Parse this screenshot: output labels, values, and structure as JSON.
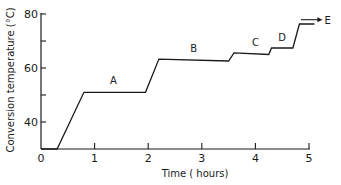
{
  "chart_data": {
    "type": "line",
    "title": "",
    "xlabel": "Time ( hours)",
    "ylabel": "Conversion temperature (°C)",
    "xlim": [
      0,
      5.2
    ],
    "ylim": [
      30,
      80
    ],
    "x_ticks": [
      0,
      1,
      2,
      3,
      4,
      5
    ],
    "x_tick_labels": [
      "0",
      "1",
      "2",
      "3",
      "4",
      "5"
    ],
    "y_ticks": [
      40,
      60,
      80
    ],
    "y_tick_labels": [
      "40",
      "60",
      "80"
    ],
    "y_minor_ticks": [
      50,
      70
    ],
    "grid": false,
    "legend": null,
    "series": [
      {
        "name": "Conversion temperature",
        "points": [
          {
            "x": 0.0,
            "y": 30
          },
          {
            "x": 0.3,
            "y": 30
          },
          {
            "x": 0.8,
            "y": 51
          },
          {
            "x": 1.95,
            "y": 51
          },
          {
            "x": 2.2,
            "y": 63.3
          },
          {
            "x": 3.5,
            "y": 62.6
          },
          {
            "x": 3.6,
            "y": 65.6
          },
          {
            "x": 4.25,
            "y": 65
          },
          {
            "x": 4.3,
            "y": 67.4
          },
          {
            "x": 4.7,
            "y": 67.4
          },
          {
            "x": 4.82,
            "y": 76.3
          },
          {
            "x": 5.1,
            "y": 76.3
          }
        ]
      }
    ],
    "annotations": [
      {
        "text": "A",
        "x": 1.35,
        "y": 54
      },
      {
        "text": "B",
        "x": 2.85,
        "y": 66
      },
      {
        "text": "C",
        "x": 4.0,
        "y": 68
      },
      {
        "text": "D",
        "x": 4.5,
        "y": 70
      },
      {
        "text": "E",
        "x": 5.35,
        "y": 79,
        "arrow_from_x": 4.85,
        "arrow_to_x": 5.25
      }
    ]
  }
}
